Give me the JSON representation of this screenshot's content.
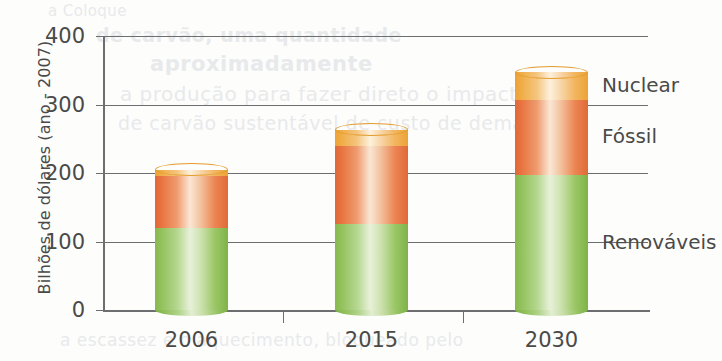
{
  "chart_data": {
    "type": "bar",
    "subtype": "stacked-column",
    "title": "",
    "xlabel": "",
    "ylabel": "Bilhões de dólares (ano - 2007)",
    "categories": [
      "2006",
      "2015",
      "2030"
    ],
    "ylim": [
      0,
      400
    ],
    "yticks": [
      0,
      100,
      200,
      300,
      400
    ],
    "ytick_labels": [
      "0",
      "100",
      "200",
      "300",
      "400"
    ],
    "grid": true,
    "legend_position": "right-inline",
    "series": [
      {
        "name": "Renováveis",
        "color": "#7fb348",
        "values": [
          120,
          126,
          197
        ]
      },
      {
        "name": "Fóssil",
        "color": "#e2673a",
        "values": [
          75,
          114,
          110
        ]
      },
      {
        "name": "Nuclear",
        "color": "#eca430",
        "values": [
          10,
          23,
          40
        ]
      }
    ],
    "totals": [
      205,
      263,
      347
    ]
  },
  "axis": {
    "y_title": "Bilhões de dólares (ano - 2007)",
    "y_ticks": [
      {
        "label": "400",
        "value": 400
      },
      {
        "label": "300",
        "value": 300
      },
      {
        "label": "200",
        "value": 200
      },
      {
        "label": "100",
        "value": 100
      },
      {
        "label": "0",
        "value": 0
      }
    ],
    "x_ticks": [
      {
        "label": "2006"
      },
      {
        "label": "2015"
      },
      {
        "label": "2030"
      }
    ]
  },
  "legend": {
    "items": [
      {
        "label": "Nuclear"
      },
      {
        "label": "Fóssil"
      },
      {
        "label": "Renováveis"
      }
    ]
  },
  "background_bleed": {
    "line1": "a Coloque",
    "line2": "de carvão, uma quantidade",
    "line3": "aproximadamente",
    "line4": "a produção para fazer direto o impacto",
    "line5": "de carvão sustentável de custo de demanda",
    "line6": "a escassez e o aquecimento, bloqueado pelo"
  }
}
